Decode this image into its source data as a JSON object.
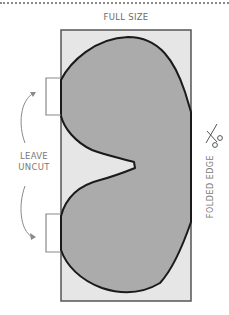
{
  "diagram": {
    "title": "FULL SIZE",
    "left_label": {
      "line1": "LEAVE",
      "line2": "UNCUT"
    },
    "right_label": "FOLDED EDGE",
    "icons": {
      "scissors": "scissors-icon"
    },
    "colors": {
      "frame_fill": "#e6e6e6",
      "frame_border": "#555555",
      "shape_fill": "#ababab",
      "shape_outline": "#1a1a1a",
      "annotation": "#8a8a8a",
      "text": "#6b6b6b"
    }
  }
}
